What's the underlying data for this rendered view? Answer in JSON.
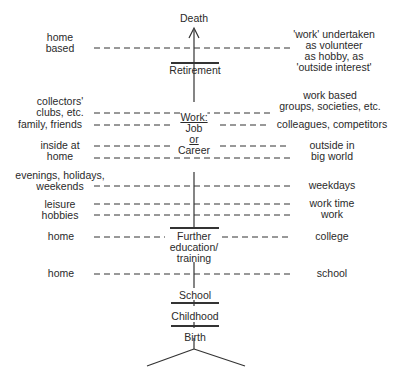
{
  "stages": {
    "death": "Death",
    "retirement": "Retirement",
    "work": "Work:",
    "job": "Job",
    "or": "or",
    "career": "Career",
    "further_1": "Further",
    "further_2": "education/",
    "further_3": "training",
    "school": "School",
    "childhood": "Childhood",
    "birth": "Birth"
  },
  "left_labels": {
    "home_based_1": "home",
    "home_based_2": "based",
    "collectors_1": "collectors'",
    "collectors_2": "clubs, etc.",
    "family": "family, friends",
    "inside_1": "inside at",
    "inside_2": "home",
    "evenings_1": "evenings, holidays,",
    "evenings_2": "weekends",
    "leisure": "leisure",
    "hobbies": "hobbies",
    "home_further": "home",
    "home_school": "home"
  },
  "right_labels": {
    "volunteer_1": "'work' undertaken",
    "volunteer_2": "as volunteer",
    "volunteer_3": "as hobby, as",
    "volunteer_4": "'outside interest'",
    "workbased_1": "work based",
    "workbased_2": "groups, societies, etc.",
    "colleagues": "colleagues, competitors",
    "outside_1": "outside in",
    "outside_2": "big world",
    "weekdays": "weekdays",
    "worktime": "work time",
    "work": "work",
    "college": "college",
    "school": "school"
  }
}
